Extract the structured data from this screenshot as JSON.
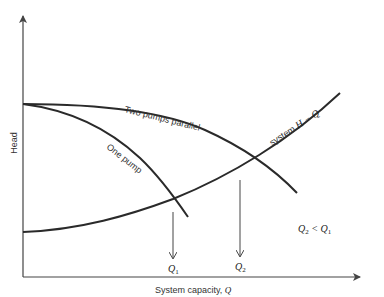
{
  "diagram": {
    "y_axis_label": "Head",
    "x_axis_label_prefix": "System capacity, ",
    "x_axis_label_var": "Q",
    "curves": {
      "two_pumps": "Two pumps parallel",
      "one_pump": "One pump",
      "system_prefix": "system ",
      "system_var": "H − Q"
    },
    "markers": {
      "q1": "Q",
      "q1_sub": "1",
      "q2": "Q",
      "q2_sub": "2"
    },
    "relation": {
      "left": "Q",
      "left_sub": "2",
      "op": " < ",
      "right": "Q",
      "right_sub": "1"
    },
    "colors": {
      "curve": "#2a2a2a",
      "axis": "#444444",
      "text": "#333333"
    }
  }
}
